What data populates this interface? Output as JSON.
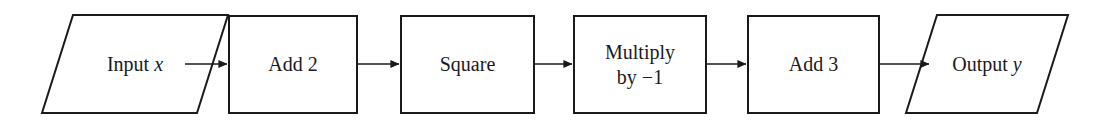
{
  "diagram": {
    "type": "flowchart",
    "orientation": "left-to-right",
    "background_color": "#ffffff",
    "stroke_color": "#1a1a1a",
    "fill_color": "#ffffff",
    "stroke_width": 2,
    "nodes": [
      {
        "id": "input",
        "shape": "parallelogram",
        "label_prefix": "Input ",
        "label_var": "x",
        "label_full": "Input x",
        "x": 42,
        "y": 15,
        "width": 186,
        "height": 98,
        "skew": 31
      },
      {
        "id": "add2",
        "shape": "rectangle",
        "label_full": "Add 2",
        "lines": [
          "Add 2"
        ],
        "x": 229,
        "y": 16,
        "width": 128,
        "height": 97
      },
      {
        "id": "square",
        "shape": "rectangle",
        "label_full": "Square",
        "lines": [
          "Square"
        ],
        "x": 401,
        "y": 16,
        "width": 133,
        "height": 97
      },
      {
        "id": "multiply",
        "shape": "rectangle",
        "label_full": "Multiply by −1",
        "lines": [
          "Multiply",
          "by −1"
        ],
        "x": 574,
        "y": 16,
        "width": 132,
        "height": 97
      },
      {
        "id": "add3",
        "shape": "rectangle",
        "label_full": "Add 3",
        "lines": [
          "Add 3"
        ],
        "x": 748,
        "y": 16,
        "width": 131,
        "height": 97
      },
      {
        "id": "output",
        "shape": "parallelogram",
        "label_prefix": "Output ",
        "label_var": "y",
        "label_full": "Output y",
        "x": 906,
        "y": 15,
        "width": 162,
        "height": 98,
        "skew": 31
      }
    ],
    "edges": [
      {
        "id": "e1",
        "from": "input",
        "to": "add2",
        "x1": 185,
        "x2": 229,
        "y": 64
      },
      {
        "id": "e2",
        "from": "add2",
        "to": "square",
        "x1": 357,
        "x2": 401,
        "y": 64
      },
      {
        "id": "e3",
        "from": "square",
        "to": "multiply",
        "x1": 534,
        "x2": 574,
        "y": 64
      },
      {
        "id": "e4",
        "from": "multiply",
        "to": "add3",
        "x1": 706,
        "x2": 748,
        "y": 64
      },
      {
        "id": "e5",
        "from": "add3",
        "to": "output",
        "x1": 879,
        "x2": 937,
        "y": 64
      }
    ]
  }
}
